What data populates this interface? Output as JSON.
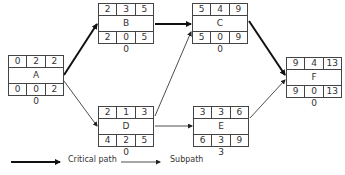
{
  "diagram": {
    "type": "activity-on-node network (critical path)",
    "nodes": [
      {
        "id": "A",
        "es": "0",
        "dur": "2",
        "ef": "2",
        "ls": "0",
        "float": "0",
        "lf": "2",
        "slack": "0"
      },
      {
        "id": "B",
        "es": "2",
        "dur": "3",
        "ef": "5",
        "ls": "2",
        "float": "0",
        "lf": "5",
        "slack": "0"
      },
      {
        "id": "C",
        "es": "5",
        "dur": "4",
        "ef": "9",
        "ls": "5",
        "float": "0",
        "lf": "9",
        "slack": "0"
      },
      {
        "id": "D",
        "es": "2",
        "dur": "1",
        "ef": "3",
        "ls": "4",
        "float": "2",
        "lf": "5",
        "slack": "0"
      },
      {
        "id": "E",
        "es": "3",
        "dur": "3",
        "ef": "6",
        "ls": "6",
        "float": "3",
        "lf": "9",
        "slack": "3"
      },
      {
        "id": "F",
        "es": "9",
        "dur": "4",
        "ef": "13",
        "ls": "9",
        "float": "0",
        "lf": "13",
        "slack": "0"
      }
    ],
    "edges": [
      {
        "from": "A",
        "to": "B",
        "kind": "critical"
      },
      {
        "from": "B",
        "to": "C",
        "kind": "critical"
      },
      {
        "from": "C",
        "to": "F",
        "kind": "critical"
      },
      {
        "from": "A",
        "to": "D",
        "kind": "sub"
      },
      {
        "from": "D",
        "to": "C",
        "kind": "sub"
      },
      {
        "from": "D",
        "to": "E",
        "kind": "sub"
      },
      {
        "from": "E",
        "to": "F",
        "kind": "sub"
      }
    ]
  },
  "legend": {
    "critical_label": "Critical path",
    "sub_label": "Subpath"
  }
}
